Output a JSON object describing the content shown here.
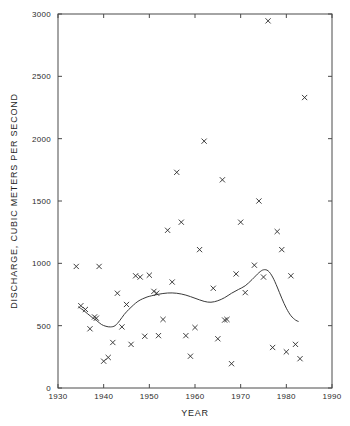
{
  "chart_data": {
    "type": "scatter",
    "title": "",
    "xlabel": "YEAR",
    "ylabel": "DISCHARGE, CUBIC METERS PER SECOND",
    "xlim": [
      1930,
      1990
    ],
    "ylim": [
      0,
      3000
    ],
    "xticks": [
      1930,
      1940,
      1950,
      1960,
      1970,
      1980,
      1990
    ],
    "xticklabels": [
      "1930",
      "1940",
      "1950",
      "1960",
      "1970",
      "1980",
      "1990"
    ],
    "yticks": [
      0,
      500,
      1000,
      1500,
      2000,
      2500,
      3000
    ],
    "yticklabels": [
      "0",
      "500",
      "1000",
      "1500",
      "2000",
      "2500",
      "3000"
    ],
    "grid": false,
    "legend": false,
    "marker": "x",
    "marker_color": "#2a2a2a",
    "line_color": "#3a3a3a",
    "series": [
      {
        "name": "Annual discharge",
        "marker": "x",
        "points": [
          {
            "x": 1934,
            "y": 975
          },
          {
            "x": 1935,
            "y": 660
          },
          {
            "x": 1936,
            "y": 630
          },
          {
            "x": 1937,
            "y": 475
          },
          {
            "x": 1938,
            "y": 570
          },
          {
            "x": 1938.4,
            "y": 560
          },
          {
            "x": 1939,
            "y": 975
          },
          {
            "x": 1940,
            "y": 215
          },
          {
            "x": 1941,
            "y": 245
          },
          {
            "x": 1942,
            "y": 365
          },
          {
            "x": 1943,
            "y": 760
          },
          {
            "x": 1944,
            "y": 490
          },
          {
            "x": 1945,
            "y": 670
          },
          {
            "x": 1946,
            "y": 350
          },
          {
            "x": 1947,
            "y": 900
          },
          {
            "x": 1948,
            "y": 890
          },
          {
            "x": 1949,
            "y": 415
          },
          {
            "x": 1950,
            "y": 905
          },
          {
            "x": 1951,
            "y": 775
          },
          {
            "x": 1951.6,
            "y": 760
          },
          {
            "x": 1952,
            "y": 420
          },
          {
            "x": 1953,
            "y": 550
          },
          {
            "x": 1954,
            "y": 1265
          },
          {
            "x": 1955,
            "y": 850
          },
          {
            "x": 1956,
            "y": 1730
          },
          {
            "x": 1957,
            "y": 1330
          },
          {
            "x": 1958,
            "y": 420
          },
          {
            "x": 1959,
            "y": 255
          },
          {
            "x": 1960,
            "y": 485
          },
          {
            "x": 1961,
            "y": 1110
          },
          {
            "x": 1962,
            "y": 1980
          },
          {
            "x": 1964,
            "y": 800
          },
          {
            "x": 1965,
            "y": 395
          },
          {
            "x": 1966,
            "y": 1670
          },
          {
            "x": 1966.5,
            "y": 545
          },
          {
            "x": 1967,
            "y": 550
          },
          {
            "x": 1968,
            "y": 195
          },
          {
            "x": 1969,
            "y": 915
          },
          {
            "x": 1970,
            "y": 1330
          },
          {
            "x": 1971,
            "y": 765
          },
          {
            "x": 1973,
            "y": 985
          },
          {
            "x": 1974,
            "y": 1500
          },
          {
            "x": 1975,
            "y": 890
          },
          {
            "x": 1976,
            "y": 2945
          },
          {
            "x": 1977,
            "y": 325
          },
          {
            "x": 1978,
            "y": 1255
          },
          {
            "x": 1979,
            "y": 1110
          },
          {
            "x": 1980,
            "y": 290
          },
          {
            "x": 1981,
            "y": 900
          },
          {
            "x": 1982,
            "y": 350
          },
          {
            "x": 1983,
            "y": 235
          },
          {
            "x": 1984,
            "y": 2330
          }
        ]
      }
    ],
    "trend": {
      "name": "Smoothed trend",
      "type": "line",
      "points": [
        {
          "x": 1934.5,
          "y": 650
        },
        {
          "x": 1935.5,
          "y": 625
        },
        {
          "x": 1936.5,
          "y": 595
        },
        {
          "x": 1937.5,
          "y": 565
        },
        {
          "x": 1938.5,
          "y": 540
        },
        {
          "x": 1939.5,
          "y": 510
        },
        {
          "x": 1940.5,
          "y": 495
        },
        {
          "x": 1941.5,
          "y": 490
        },
        {
          "x": 1942.5,
          "y": 500
        },
        {
          "x": 1943.5,
          "y": 540
        },
        {
          "x": 1944.5,
          "y": 590
        },
        {
          "x": 1945.5,
          "y": 630
        },
        {
          "x": 1946.5,
          "y": 665
        },
        {
          "x": 1947.5,
          "y": 695
        },
        {
          "x": 1948.5,
          "y": 715
        },
        {
          "x": 1949.5,
          "y": 730
        },
        {
          "x": 1950.5,
          "y": 740
        },
        {
          "x": 1952,
          "y": 752
        },
        {
          "x": 1954,
          "y": 762
        },
        {
          "x": 1956,
          "y": 760
        },
        {
          "x": 1958,
          "y": 745
        },
        {
          "x": 1960,
          "y": 720
        },
        {
          "x": 1962,
          "y": 695
        },
        {
          "x": 1963.5,
          "y": 688
        },
        {
          "x": 1965,
          "y": 700
        },
        {
          "x": 1966.5,
          "y": 725
        },
        {
          "x": 1968,
          "y": 760
        },
        {
          "x": 1969.5,
          "y": 790
        },
        {
          "x": 1971,
          "y": 820
        },
        {
          "x": 1972.5,
          "y": 870
        },
        {
          "x": 1974,
          "y": 925
        },
        {
          "x": 1975,
          "y": 948
        },
        {
          "x": 1976,
          "y": 940
        },
        {
          "x": 1977,
          "y": 890
        },
        {
          "x": 1978,
          "y": 810
        },
        {
          "x": 1979,
          "y": 720
        },
        {
          "x": 1980,
          "y": 640
        },
        {
          "x": 1981,
          "y": 580
        },
        {
          "x": 1982,
          "y": 545
        },
        {
          "x": 1982.6,
          "y": 535
        }
      ]
    }
  }
}
